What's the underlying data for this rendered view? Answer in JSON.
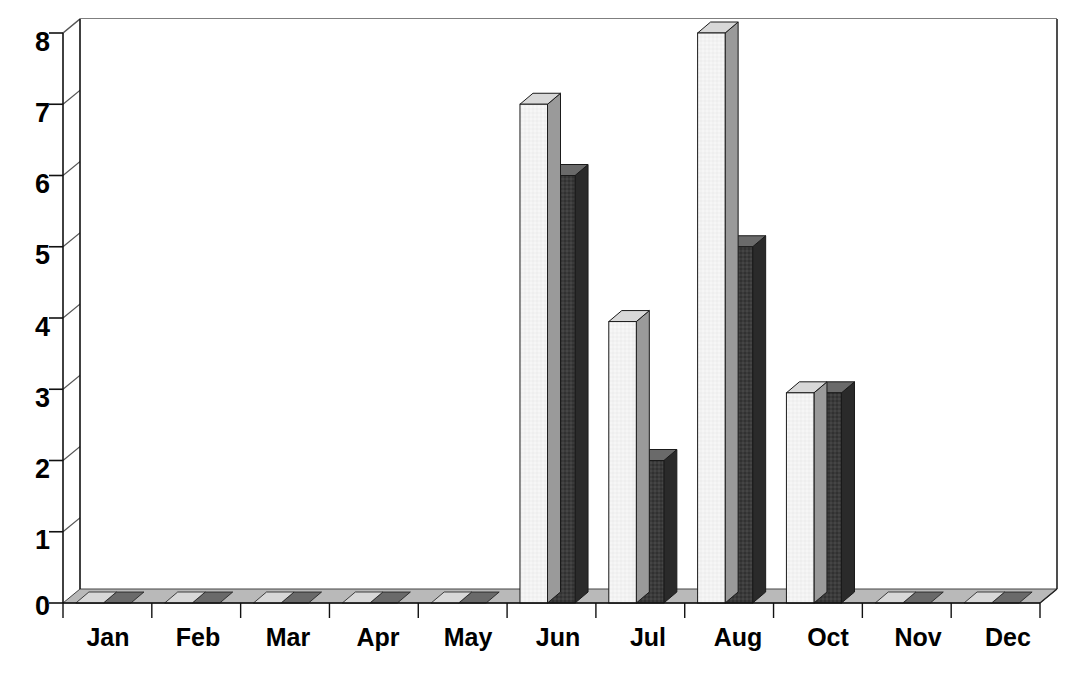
{
  "chart_data": {
    "type": "bar",
    "title": "",
    "subtitle": "",
    "xlabel": "",
    "ylabel": "",
    "categories": [
      "Jan",
      "Feb",
      "Mar",
      "Apr",
      "May",
      "Jun",
      "Jul",
      "Aug",
      "Oct",
      "Nov",
      "Dec"
    ],
    "series": [
      {
        "name": "Series 1",
        "color": "#f2f2f2",
        "values": [
          0,
          0,
          0,
          0,
          0,
          7,
          3.95,
          8,
          2.95,
          0,
          0
        ]
      },
      {
        "name": "Series 2",
        "color": "#3b3b3b",
        "values": [
          0,
          0,
          0,
          0,
          0,
          6,
          2,
          5,
          2.95,
          0,
          0
        ]
      }
    ],
    "ylim": [
      0,
      8
    ],
    "yticks": [
      0,
      1,
      2,
      3,
      4,
      5,
      6,
      7,
      8
    ],
    "ytick_labels": [
      "0",
      "1",
      "2",
      "3",
      "4",
      "5",
      "6",
      "7",
      "8"
    ],
    "grid": true,
    "grid_axis": "y",
    "legend": false,
    "legend_position": "none",
    "style": "3d-column",
    "background": "#ffffff",
    "axis_color": "#000000",
    "grid_color": "#555555"
  },
  "axis": {
    "y_labels": [
      "8",
      "7",
      "6",
      "5",
      "4",
      "3",
      "2",
      "1",
      "0"
    ],
    "x_labels": [
      "Jan",
      "Feb",
      "Mar",
      "Apr",
      "May",
      "Jun",
      "Jul",
      "Aug",
      "Oct",
      "Nov",
      "Dec"
    ]
  }
}
